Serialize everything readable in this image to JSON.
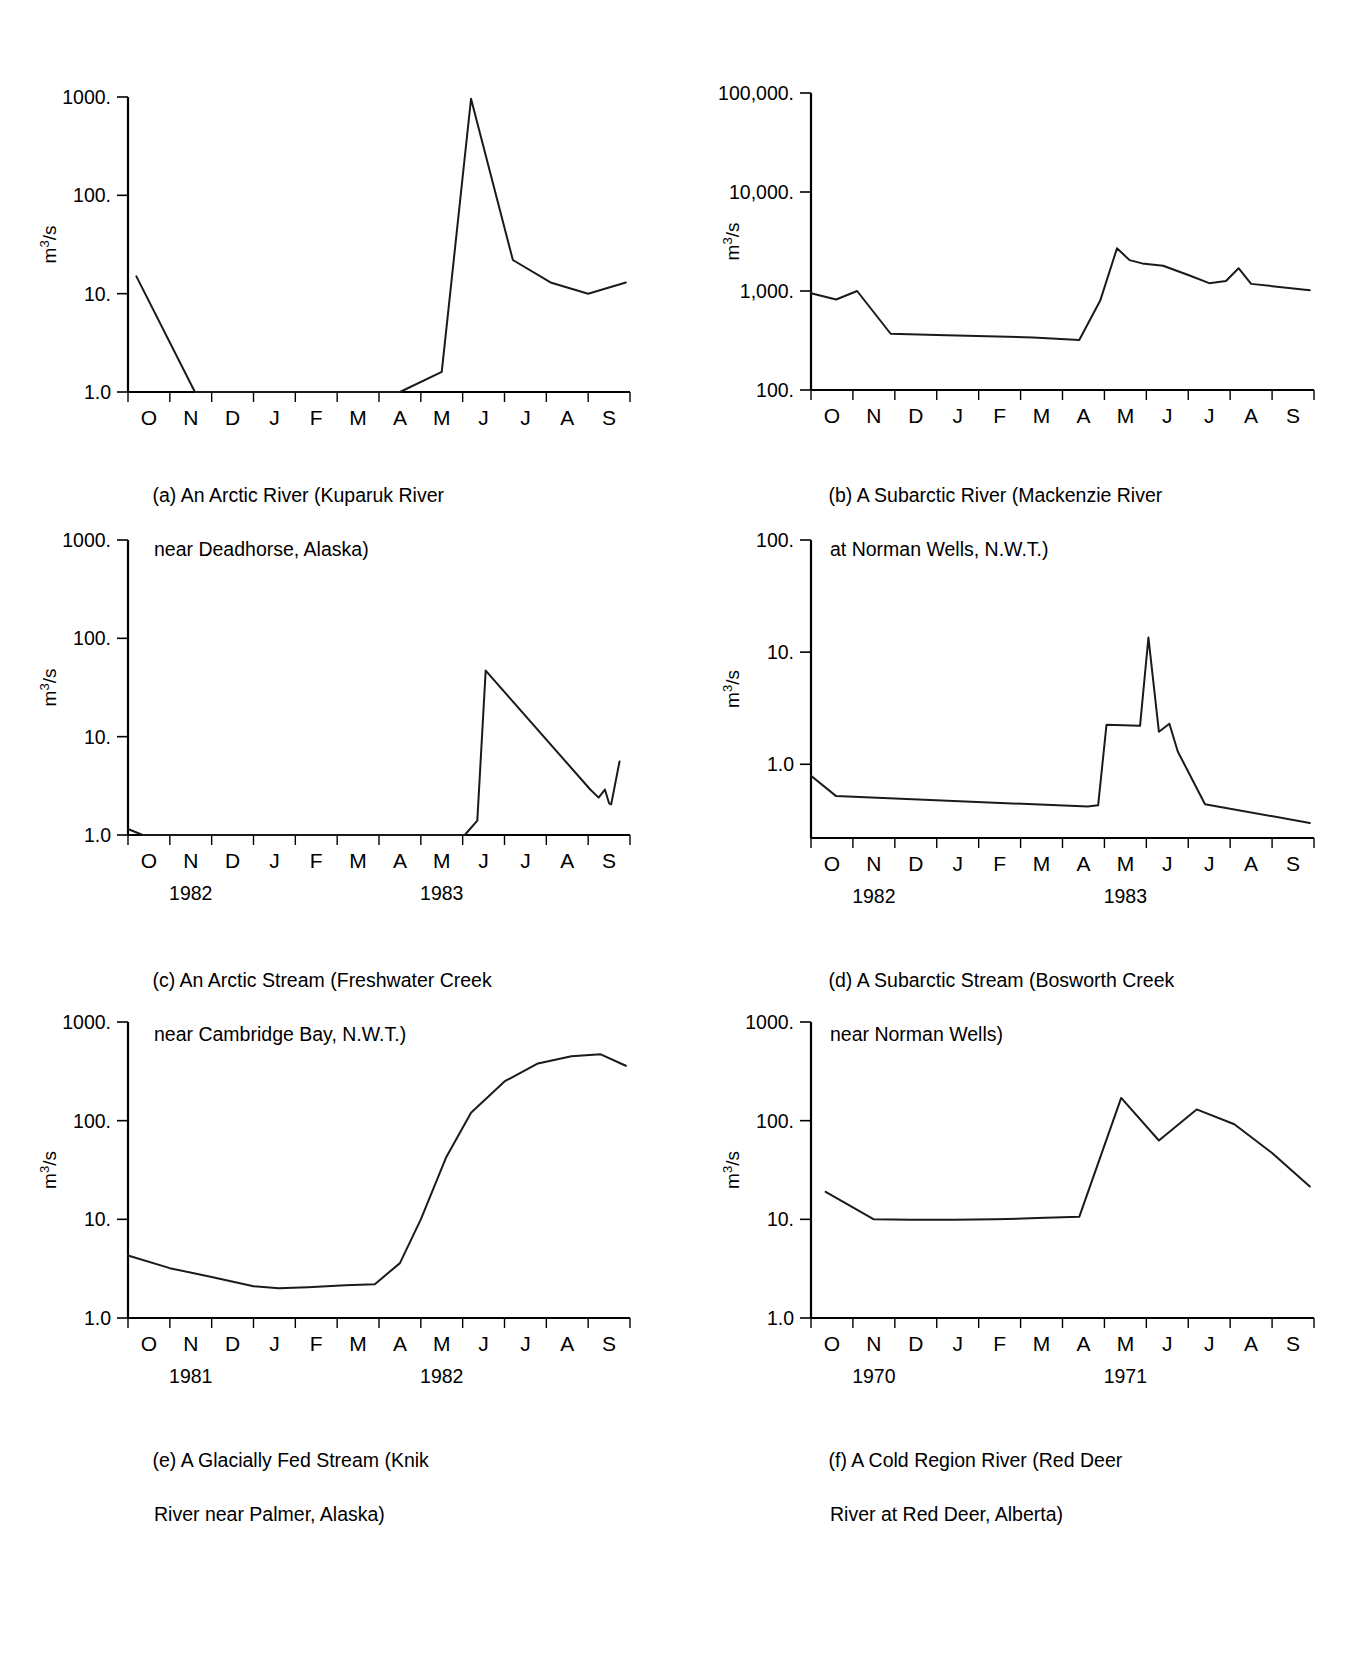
{
  "figure": {
    "axis_y_label": "m3/s",
    "axis_y_label_html": "m³/s",
    "months": [
      "O",
      "N",
      "D",
      "J",
      "F",
      "M",
      "A",
      "M",
      "J",
      "J",
      "A",
      "S"
    ]
  },
  "chart_data": [
    {
      "id": "a",
      "type": "line",
      "title": "(a) An Arctic River (Kuparuk River",
      "title_line2": "near Deadhorse, Alaska)",
      "caption_line1": "(a) An Arctic River (Kuparuk River",
      "caption_line2": "near Deadhorse, Alaska)",
      "xlabel": "",
      "ylabel": "m³/s",
      "ytick_labels": [
        "1000.",
        "100.",
        "10.",
        "1.0"
      ],
      "ytick_values": [
        1000,
        100,
        10,
        1
      ],
      "ylim": [
        1,
        1000
      ],
      "yscale": "log",
      "x_tick_labels": [
        "O",
        "N",
        "D",
        "J",
        "F",
        "M",
        "A",
        "M",
        "J",
        "J",
        "A",
        "S"
      ],
      "year_labels": [
        "1981",
        "1982"
      ],
      "year_positions": [
        1.0,
        7.0
      ],
      "grid": false,
      "legend": "none",
      "x": [
        0.2,
        1.6,
        6.5,
        7.5,
        8.2,
        9.2,
        10.1,
        11.0,
        11.9
      ],
      "values": [
        15.0,
        1.0,
        1.0,
        1.6,
        960.0,
        22.0,
        13.0,
        10.0,
        13.0
      ]
    },
    {
      "id": "b",
      "type": "line",
      "title": "(b) A Subarctic River (Mackenzie River",
      "title_line2": "at Norman Wells, N.W.T.)",
      "caption_line1": "(b) A Subarctic River (Mackenzie River",
      "caption_line2": "at Norman Wells, N.W.T.)",
      "xlabel": "",
      "ylabel": "m³/s",
      "ytick_labels": [
        "100,000.",
        "10,000.",
        "1,000.",
        "100."
      ],
      "ytick_values": [
        100000,
        10000,
        1000,
        100
      ],
      "ylim": [
        100,
        100000
      ],
      "yscale": "log",
      "x_tick_labels": [
        "O",
        "N",
        "D",
        "J",
        "F",
        "M",
        "A",
        "M",
        "J",
        "J",
        "A",
        "S"
      ],
      "year_labels": [
        "1982",
        "1983"
      ],
      "year_positions": [
        1.0,
        7.0
      ],
      "grid": false,
      "legend": "none",
      "x": [
        0.0,
        0.6,
        1.1,
        1.9,
        3.0,
        4.2,
        5.3,
        6.4,
        6.9,
        7.3,
        7.6,
        7.9,
        8.4,
        9.0,
        9.5,
        9.9,
        10.2,
        10.5,
        11.9
      ],
      "values": [
        950,
        820,
        1000,
        370,
        360,
        350,
        340,
        320,
        800,
        2700,
        2050,
        1900,
        1800,
        1450,
        1200,
        1260,
        1700,
        1180,
        1020
      ]
    },
    {
      "id": "c",
      "type": "line",
      "title": "(c) An Arctic Stream (Freshwater Creek",
      "title_line2": "near Cambridge Bay, N.W.T.)",
      "caption_line1": "(c) An Arctic Stream (Freshwater Creek",
      "caption_line2": "near Cambridge Bay, N.W.T.)",
      "xlabel": "",
      "ylabel": "m³/s",
      "ytick_labels": [
        "1000.",
        "100.",
        "10.",
        "1.0"
      ],
      "ytick_values": [
        1000,
        100,
        10,
        1
      ],
      "ylim": [
        1,
        1000
      ],
      "yscale": "log",
      "x_tick_labels": [
        "O",
        "N",
        "D",
        "J",
        "F",
        "M",
        "A",
        "M",
        "J",
        "J",
        "A",
        "S"
      ],
      "year_labels": [
        "1982",
        "1983"
      ],
      "year_positions": [
        1.0,
        7.0
      ],
      "grid": false,
      "legend": "none",
      "x": [
        0.0,
        0.35,
        8.05,
        8.35,
        8.55,
        11.05,
        11.25,
        11.4,
        11.5,
        11.55,
        11.75
      ],
      "values": [
        1.15,
        1.0,
        1.0,
        1.4,
        47.0,
        2.9,
        2.4,
        2.9,
        2.1,
        2.05,
        5.6
      ]
    },
    {
      "id": "d",
      "type": "line",
      "title": "(d) A Subarctic Stream (Bosworth Creek",
      "title_line2": "near Norman Wells)",
      "caption_line1": "(d) A Subarctic Stream (Bosworth Creek",
      "caption_line2": "near Norman Wells)",
      "xlabel": "",
      "ylabel": "m³/s",
      "ytick_labels": [
        "100.",
        "10.",
        "1.0"
      ],
      "ytick_values": [
        100,
        10,
        1
      ],
      "ylim": [
        0.22,
        100
      ],
      "yscale": "log",
      "x_tick_labels": [
        "O",
        "N",
        "D",
        "J",
        "F",
        "M",
        "A",
        "M",
        "J",
        "J",
        "A",
        "S"
      ],
      "year_labels": [
        "1982",
        "1983"
      ],
      "year_positions": [
        1.0,
        7.0
      ],
      "grid": false,
      "legend": "none",
      "x": [
        0.0,
        0.6,
        6.6,
        6.85,
        7.05,
        7.85,
        8.05,
        8.3,
        8.55,
        8.75,
        9.4,
        11.9
      ],
      "values": [
        0.79,
        0.52,
        0.42,
        0.43,
        2.25,
        2.2,
        13.5,
        1.95,
        2.3,
        1.3,
        0.44,
        0.3
      ]
    },
    {
      "id": "e",
      "type": "line",
      "title": "(e) A Glacially Fed Stream (Knik",
      "title_line2": "River near Palmer, Alaska)",
      "caption_line1": "(e) A Glacially Fed Stream (Knik",
      "caption_line2": "River near Palmer, Alaska)",
      "xlabel": "",
      "ylabel": "m³/s",
      "ytick_labels": [
        "1000.",
        "100.",
        "10.",
        "1.0"
      ],
      "ytick_values": [
        1000,
        100,
        10,
        1
      ],
      "ylim": [
        1,
        1000
      ],
      "yscale": "log",
      "x_tick_labels": [
        "O",
        "N",
        "D",
        "J",
        "F",
        "M",
        "A",
        "M",
        "J",
        "J",
        "A",
        "S"
      ],
      "year_labels": [
        "1981",
        "1982"
      ],
      "year_positions": [
        1.0,
        7.0
      ],
      "grid": false,
      "legend": "none",
      "x": [
        0.0,
        1.0,
        2.0,
        3.0,
        3.6,
        4.3,
        5.2,
        5.9,
        6.5,
        7.0,
        7.6,
        8.2,
        9.0,
        9.8,
        10.6,
        11.3,
        11.9
      ],
      "values": [
        4.3,
        3.2,
        2.6,
        2.1,
        2.0,
        2.05,
        2.15,
        2.2,
        3.6,
        10.0,
        42.0,
        120.0,
        250.0,
        380.0,
        450.0,
        470.0,
        360.0
      ]
    },
    {
      "id": "f",
      "type": "line",
      "title": "(f) A Cold Region River (Red Deer",
      "title_line2": "River at Red Deer, Alberta)",
      "caption_line1": "(f) A Cold Region River (Red Deer",
      "caption_line2": "River at Red Deer, Alberta)",
      "xlabel": "",
      "ylabel": "m³/s",
      "ytick_labels": [
        "1000.",
        "100.",
        "10.",
        "1.0"
      ],
      "ytick_values": [
        1000,
        100,
        10,
        1
      ],
      "ylim": [
        1,
        1000
      ],
      "yscale": "log",
      "x_tick_labels": [
        "O",
        "N",
        "D",
        "J",
        "F",
        "M",
        "A",
        "M",
        "J",
        "J",
        "A",
        "S"
      ],
      "year_labels": [
        "1970",
        "1971"
      ],
      "year_positions": [
        1.0,
        7.0
      ],
      "grid": false,
      "legend": "none",
      "x": [
        0.35,
        1.5,
        2.4,
        3.4,
        4.4,
        5.4,
        6.4,
        7.4,
        8.3,
        9.2,
        10.1,
        11.0,
        11.9
      ],
      "values": [
        19.0,
        10.0,
        9.9,
        9.9,
        10.0,
        10.3,
        10.6,
        170.0,
        63.0,
        130.0,
        92.0,
        47.0,
        21.5
      ]
    }
  ]
}
